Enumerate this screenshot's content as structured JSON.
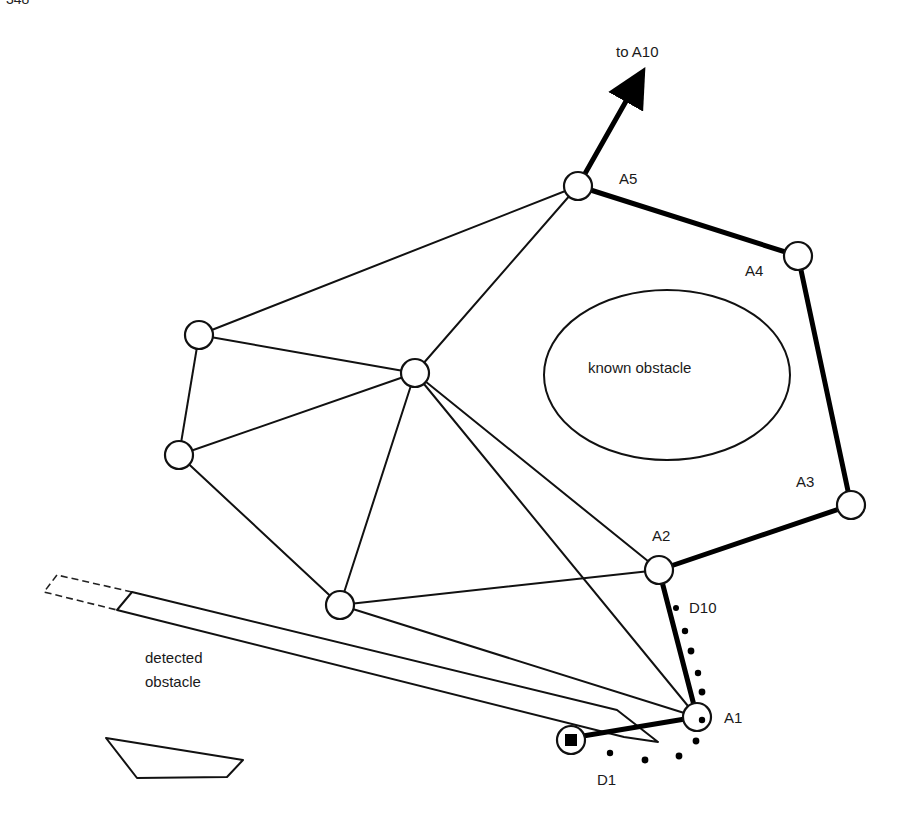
{
  "page": {
    "number": "348"
  },
  "diagram": {
    "arrow_label": "to A10",
    "known_obstacle_label": "known obstacle",
    "detected_obstacle_label_line1": "detected",
    "detected_obstacle_label_line2": "obstacle",
    "nodes": {
      "A1": {
        "label": "A1",
        "x": 697,
        "y": 717
      },
      "A2": {
        "label": "A2",
        "x": 659,
        "y": 570
      },
      "A3": {
        "label": "A3",
        "x": 851,
        "y": 505
      },
      "A4": {
        "label": "A4",
        "x": 798,
        "y": 256
      },
      "A5": {
        "label": "A5",
        "x": 578,
        "y": 186
      },
      "N1": {
        "x": 199,
        "y": 335
      },
      "N2": {
        "x": 179,
        "y": 455
      },
      "N3": {
        "x": 340,
        "y": 605
      },
      "C": {
        "x": 415,
        "y": 373
      },
      "start": {
        "x": 571,
        "y": 738
      }
    },
    "dot_labels": {
      "first": "D1",
      "last": "D10"
    },
    "colors": {
      "ink": "#111111",
      "background": "#ffffff"
    }
  }
}
